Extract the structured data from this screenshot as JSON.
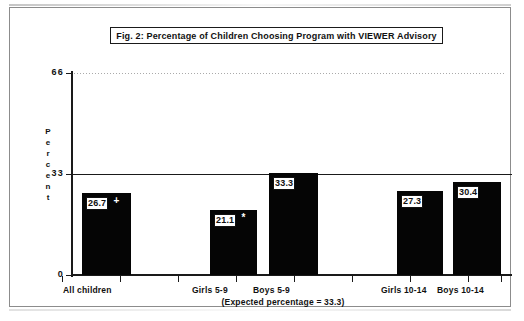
{
  "figure": {
    "title": "Fig. 2:  Percentage of Children Choosing Program with VIEWER Advisory",
    "caption": "(Expected percentage = 33.3)",
    "y_axis_title_letters": [
      "P",
      "e",
      "r",
      "c",
      "e",
      "n",
      "t"
    ]
  },
  "chart_data": {
    "type": "bar",
    "title": "Fig. 2:  Percentage of Children Choosing Program with VIEWER Advisory",
    "xlabel": "",
    "ylabel": "Percent",
    "categories": [
      "All children",
      "Girls  5-9",
      "Boys  5-9",
      "Girls  10-14",
      "Boys  10-14"
    ],
    "values": [
      26.7,
      21.1,
      33.3,
      27.3,
      30.4
    ],
    "value_labels": [
      "26.7",
      "21.1",
      "33.3",
      "27.3",
      "30.4"
    ],
    "significance_markers": [
      "+",
      "*",
      "",
      "",
      ""
    ],
    "ylim": [
      0,
      66
    ],
    "yticks": [
      0,
      33,
      66
    ],
    "ytick_labels": [
      "0",
      "33",
      "66"
    ],
    "gridlines": {
      "33": "solid",
      "66": "dotted"
    },
    "reference_line": 33.3,
    "annotation": "(Expected percentage = 33.3)",
    "legend": "none",
    "bar_color": "#050505"
  },
  "colors": {
    "bar": "#050505",
    "axis": "#1a1a1a",
    "frame": "#8c8c8c",
    "label_box_bg": "#ffffff"
  }
}
